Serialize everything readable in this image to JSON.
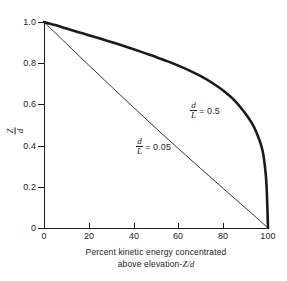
{
  "figure": {
    "background_color": "#ffffff",
    "ink_color": "#1a1a1a"
  },
  "axes": {
    "x": {
      "title_line1": "Percent kinetic energy concentrated",
      "title_line2_prefix": "above elevation-",
      "title_line2_var1": "Z",
      "title_line2_sep": "/",
      "title_line2_var2": "d",
      "ticks": [
        "0",
        "20",
        "40",
        "60",
        "80",
        "100"
      ],
      "tick_values": [
        0,
        20,
        40,
        60,
        80,
        100
      ],
      "range": [
        0,
        100
      ]
    },
    "y": {
      "title_numerator": "Z",
      "title_denominator": "d",
      "ticks": [
        "0",
        "0.2",
        "0.4",
        "0.6",
        "0.8",
        "1.0"
      ],
      "tick_values": [
        0,
        0.2,
        0.4,
        0.6,
        0.8,
        1.0
      ],
      "range": [
        0,
        1.0
      ]
    }
  },
  "annotations": {
    "curve_05": {
      "numerator": "d",
      "denominator": "L",
      "equals": "= 0.5"
    },
    "curve_005": {
      "numerator": "d",
      "denominator": "L",
      "equals": "= 0.05"
    }
  },
  "chart_data": {
    "type": "line",
    "title": "",
    "xlabel": "Percent kinetic energy concentrated above elevation-Z/d",
    "ylabel": "Z/d",
    "xlim": [
      0,
      100
    ],
    "ylim": [
      0,
      1.0
    ],
    "xticks": [
      0,
      20,
      40,
      60,
      80,
      100
    ],
    "yticks": [
      0,
      0.2,
      0.4,
      0.6,
      0.8,
      1.0
    ],
    "grid": false,
    "legend_position": "inline-annotations",
    "series": [
      {
        "name": "d/L = 0.5",
        "linewidth": "thick",
        "color": "#1a1a1a",
        "x": [
          0,
          5,
          10,
          15,
          20,
          25,
          30,
          35,
          40,
          45,
          50,
          55,
          60,
          65,
          70,
          75,
          80,
          85,
          90,
          93,
          95,
          97,
          98,
          99,
          99.5,
          100
        ],
        "y": [
          1.0,
          0.985,
          0.968,
          0.952,
          0.936,
          0.92,
          0.903,
          0.886,
          0.868,
          0.849,
          0.83,
          0.81,
          0.788,
          0.764,
          0.737,
          0.705,
          0.667,
          0.62,
          0.555,
          0.505,
          0.46,
          0.4,
          0.35,
          0.26,
          0.17,
          0.0
        ]
      },
      {
        "name": "d/L = 0.05",
        "linewidth": "thin",
        "color": "#1a1a1a",
        "x": [
          0,
          10,
          20,
          30,
          40,
          50,
          60,
          70,
          80,
          90,
          95,
          100
        ],
        "y": [
          1.0,
          0.895,
          0.79,
          0.687,
          0.585,
          0.484,
          0.385,
          0.288,
          0.192,
          0.097,
          0.049,
          0.0
        ]
      }
    ]
  }
}
